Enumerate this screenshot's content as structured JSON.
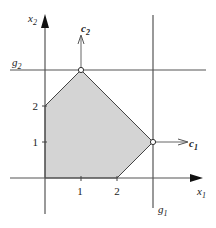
{
  "diagram": {
    "type": "linear-programming-feasible-region",
    "axes": {
      "x_label": "x",
      "x_sub": "1",
      "y_label": "x",
      "y_sub": "2",
      "x_ticks": [
        "1",
        "2"
      ],
      "y_ticks": [
        "1",
        "2"
      ]
    },
    "lines": {
      "g1": {
        "label": "g",
        "sub": "1",
        "equation": "x1 = 3"
      },
      "g2": {
        "label": "g",
        "sub": "2",
        "equation": "x2 = 3"
      }
    },
    "vectors": {
      "c1": {
        "label": "c",
        "sub": "1",
        "from": [
          3,
          1
        ],
        "direction": [
          1,
          0
        ]
      },
      "c2": {
        "label": "c",
        "sub": "2",
        "from": [
          1,
          3
        ],
        "direction": [
          0,
          1
        ]
      }
    },
    "feasible_region": {
      "vertices": [
        [
          0,
          0
        ],
        [
          2,
          0
        ],
        [
          3,
          1
        ],
        [
          1,
          3
        ],
        [
          0,
          2
        ]
      ],
      "fill": "#d4d4d4"
    },
    "highlighted_points": [
      [
        1,
        3
      ],
      [
        3,
        1
      ]
    ],
    "colors": {
      "axis": "#555555",
      "constraint_line": "#555555",
      "region_fill": "#d4d4d4",
      "region_edge": "#444444"
    }
  }
}
